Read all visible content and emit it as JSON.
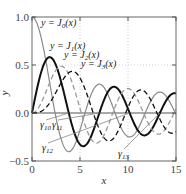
{
  "chart_data": {
    "type": "line",
    "title": "",
    "xlabel": "x",
    "ylabel": "y",
    "xlim": [
      0,
      15
    ],
    "ylim": [
      -0.5,
      1.0
    ],
    "xticks": [
      "0",
      "5",
      "10",
      "15"
    ],
    "yticks": [
      "-0.5",
      "0.0",
      "0.5",
      "1.0"
    ],
    "grid": true,
    "series": [
      {
        "name": "y = J0(x)",
        "label_main": "y = J",
        "label_sub": "0",
        "label_tail": "(x)",
        "order": 0,
        "color": "#8a8a8a",
        "style": "solid",
        "width": 1.2
      },
      {
        "name": "y = J1(x)",
        "label_main": "y = J",
        "label_sub": "1",
        "label_tail": "(x)",
        "order": 1,
        "color": "#111111",
        "style": "solid",
        "width": 2.0
      },
      {
        "name": "y = J2(x)",
        "label_main": "y = J",
        "label_sub": "2",
        "label_tail": "(x)",
        "order": 2,
        "color": "#999999",
        "style": "dashed",
        "width": 1.3
      },
      {
        "name": "y = J3(x)",
        "label_main": "y = J",
        "label_sub": "3",
        "label_tail": "(x)",
        "order": 3,
        "color": "#111111",
        "style": "dashed",
        "width": 1.3
      }
    ],
    "annotations": [
      {
        "text": "γ",
        "sub": "10",
        "x": 3.83
      },
      {
        "text": "γ",
        "sub": "11",
        "x": 7.02
      },
      {
        "text": "γ",
        "sub": "12",
        "x": 10.17
      },
      {
        "text": "γ",
        "sub": "13",
        "x": 13.32
      }
    ]
  },
  "labels": {
    "x_axis": "x",
    "y_axis": "y",
    "curves": [
      "y = J0(x)",
      "y = J1(x)",
      "y = J2(x)",
      "y = J3(x)"
    ],
    "gamma": [
      "γ10",
      "γ11",
      "γ12",
      "γ13"
    ]
  }
}
